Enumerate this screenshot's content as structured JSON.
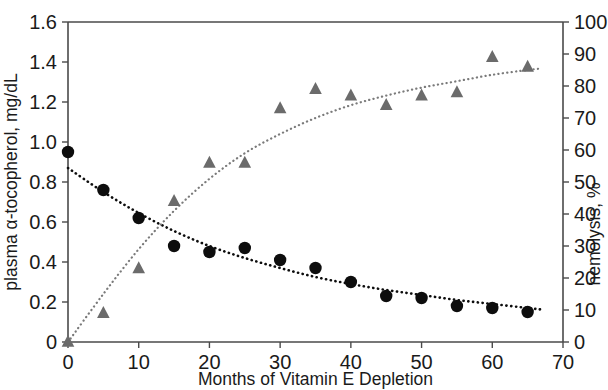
{
  "chart_data": {
    "type": "scatter",
    "title": "",
    "subtitle": "",
    "xlabel": "Months of Vitamin E Depletion",
    "ylabel": "plasma α-tocopherol, mg/dL",
    "y2label": "hemolysis, %",
    "xlim": [
      0,
      70
    ],
    "ylim": [
      0,
      1.6
    ],
    "y2lim": [
      0,
      100
    ],
    "xticks": [
      0,
      10,
      20,
      30,
      40,
      50,
      60,
      70
    ],
    "xticklabels": [
      "0",
      "10",
      "20",
      "30",
      "40",
      "50",
      "60",
      "70"
    ],
    "yticks": [
      0,
      0.2,
      0.4,
      0.6,
      0.8,
      1.0,
      1.2,
      1.4,
      1.6
    ],
    "yticklabels": [
      "0",
      "0.2",
      "0.4",
      "0.6",
      "0.8",
      "1.0",
      "1.2",
      "1.4",
      "1.6"
    ],
    "y2ticks": [
      0,
      10,
      20,
      30,
      40,
      50,
      60,
      70,
      80,
      90,
      100
    ],
    "y2ticklabels": [
      "0",
      "10",
      "20",
      "30",
      "40",
      "50",
      "60",
      "70",
      "80",
      "90",
      "100"
    ],
    "grid": false,
    "legend": "none",
    "series": [
      {
        "name": "plasma α-tocopherol",
        "marker": "circle",
        "color": "#0d0d0d",
        "axis": "left",
        "trendline": "dotted",
        "x": [
          0,
          5,
          10,
          15,
          20,
          25,
          30,
          35,
          40,
          45,
          50,
          55,
          60,
          65
        ],
        "values": [
          0.95,
          0.76,
          0.62,
          0.48,
          0.45,
          0.47,
          0.41,
          0.37,
          0.3,
          0.23,
          0.22,
          0.18,
          0.17,
          0.15
        ]
      },
      {
        "name": "hemolysis",
        "marker": "triangle",
        "color": "#6b6b6b",
        "axis": "right",
        "trendline": "dotted",
        "x": [
          0,
          5,
          10,
          15,
          20,
          25,
          30,
          35,
          40,
          45,
          50,
          55,
          60,
          65
        ],
        "values": [
          0,
          9,
          23,
          44,
          56,
          56,
          73,
          79,
          77,
          74,
          77,
          78,
          89,
          86
        ]
      }
    ],
    "trendlines": [
      {
        "name": "tocopherol-decay-fit",
        "axis": "left",
        "style": "dotted",
        "color": "#0d0d0d",
        "points": [
          [
            0,
            0.87
          ],
          [
            5,
            0.75
          ],
          [
            10,
            0.645
          ],
          [
            15,
            0.555
          ],
          [
            20,
            0.48
          ],
          [
            25,
            0.42
          ],
          [
            30,
            0.37
          ],
          [
            35,
            0.325
          ],
          [
            40,
            0.29
          ],
          [
            45,
            0.26
          ],
          [
            50,
            0.235
          ],
          [
            55,
            0.21
          ],
          [
            60,
            0.19
          ],
          [
            65,
            0.17
          ],
          [
            67,
            0.162
          ]
        ]
      },
      {
        "name": "hemolysis-rise-fit",
        "axis": "right",
        "style": "dotted",
        "color": "#7a7a7a",
        "points": [
          [
            0,
            0
          ],
          [
            5,
            15
          ],
          [
            10,
            29
          ],
          [
            15,
            41
          ],
          [
            20,
            51
          ],
          [
            25,
            59
          ],
          [
            30,
            65
          ],
          [
            35,
            70
          ],
          [
            40,
            74
          ],
          [
            45,
            77
          ],
          [
            50,
            79.5
          ],
          [
            55,
            81.5
          ],
          [
            60,
            83.5
          ],
          [
            65,
            85
          ],
          [
            67,
            85.5
          ]
        ]
      }
    ]
  }
}
